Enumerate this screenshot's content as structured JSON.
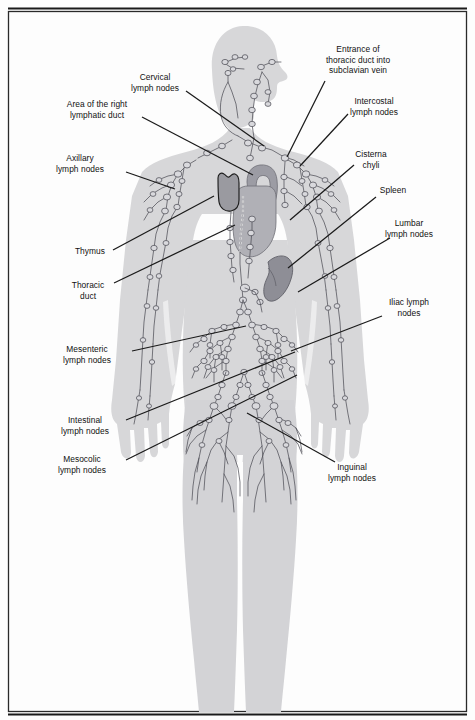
{
  "figure": {
    "title_cutoff": "Lymphatic system",
    "kind": "anatomical-diagram",
    "background_color": "#ffffff",
    "body_fill": "#d7d7d9",
    "body_fill_dark": "#cdcdd0",
    "vessel_color": "#4a4a52",
    "node_fill": "#d9d9dd",
    "thymus_fill": "#9a9aa0",
    "heart_fill": "#b0b0b6",
    "aorta_fill": "#9c9ca4",
    "spleen_fill": "#8e8e96",
    "leader_color": "#1a1a1a",
    "border_color": "#1a1a1a"
  },
  "labels": [
    {
      "id": "cervical",
      "name": "cervical-lymph-nodes",
      "lines": [
        "Cervical",
        "lymph nodes"
      ],
      "text_x": 155,
      "text_y": 80,
      "leader": {
        "x1": 186,
        "y1": 91,
        "x2": 264,
        "y2": 146
      }
    },
    {
      "id": "right-lymphatic-duct",
      "name": "area-of-right-lymphatic-duct",
      "lines": [
        "Area of the right",
        "lymphatic duct"
      ],
      "text_x": 97,
      "text_y": 107,
      "leader": {
        "x1": 142,
        "y1": 117,
        "x2": 253,
        "y2": 175
      }
    },
    {
      "id": "axillary",
      "name": "axillary-lymph-nodes",
      "lines": [
        "Axillary",
        "lymph nodes"
      ],
      "text_x": 80,
      "text_y": 161,
      "leader": {
        "x1": 126,
        "y1": 172,
        "x2": 175,
        "y2": 189
      }
    },
    {
      "id": "thymus",
      "name": "thymus",
      "lines": [
        "Thymus"
      ],
      "text_x": 90,
      "text_y": 254,
      "leader": {
        "x1": 113,
        "y1": 250,
        "x2": 214,
        "y2": 196
      }
    },
    {
      "id": "thoracic-duct",
      "name": "thoracic-duct",
      "lines": [
        "Thoracic",
        "duct"
      ],
      "text_x": 88,
      "text_y": 288,
      "leader": {
        "x1": 114,
        "y1": 283,
        "x2": 235,
        "y2": 225
      }
    },
    {
      "id": "mesenteric",
      "name": "mesenteric-lymph-nodes",
      "lines": [
        "Mesenteric",
        "lymph nodes"
      ],
      "text_x": 87,
      "text_y": 352,
      "leader": {
        "x1": 132,
        "y1": 351,
        "x2": 246,
        "y2": 326
      }
    },
    {
      "id": "intestinal",
      "name": "intestinal-lymph-nodes",
      "lines": [
        "Intestinal",
        "lymph nodes"
      ],
      "text_x": 85,
      "text_y": 423,
      "leader": {
        "x1": 126,
        "y1": 420,
        "x2": 295,
        "y2": 352
      }
    },
    {
      "id": "mesocolic",
      "name": "mesocolic-lymph-nodes",
      "lines": [
        "Mesocolic",
        "lymph nodes"
      ],
      "text_x": 82,
      "text_y": 462,
      "leader": {
        "x1": 126,
        "y1": 460,
        "x2": 297,
        "y2": 375
      }
    },
    {
      "id": "thoracic-duct-entrance",
      "name": "entrance-of-thoracic-duct-into-subclavian-vein",
      "lines": [
        "Entrance of",
        "thoracic duct into",
        "subclavian vein"
      ],
      "text_x": 358,
      "text_y": 52,
      "leader": {
        "x1": 325,
        "y1": 81,
        "x2": 287,
        "y2": 157
      }
    },
    {
      "id": "intercostal",
      "name": "intercostal-lymph-nodes",
      "lines": [
        "Intercostal",
        "lymph nodes"
      ],
      "text_x": 374,
      "text_y": 104,
      "leader": {
        "x1": 348,
        "y1": 114,
        "x2": 300,
        "y2": 166
      }
    },
    {
      "id": "cisterna-chyli",
      "name": "cisterna-chyli",
      "lines": [
        "Cisterna",
        "chyli"
      ],
      "text_x": 371,
      "text_y": 157,
      "leader": {
        "x1": 354,
        "y1": 165,
        "x2": 290,
        "y2": 220
      }
    },
    {
      "id": "spleen",
      "name": "spleen",
      "lines": [
        "Spleen"
      ],
      "text_x": 393,
      "text_y": 193,
      "leader": {
        "x1": 376,
        "y1": 197,
        "x2": 288,
        "y2": 268
      }
    },
    {
      "id": "lumbar",
      "name": "lumbar-lymph-nodes",
      "lines": [
        "Lumbar",
        "lymph nodes"
      ],
      "text_x": 409,
      "text_y": 226,
      "leader": {
        "x1": 390,
        "y1": 238,
        "x2": 298,
        "y2": 292
      }
    },
    {
      "id": "iliac",
      "name": "iliac-lymph-nodes",
      "lines": [
        "Iliac lymph",
        "nodes"
      ],
      "text_x": 409,
      "text_y": 305,
      "leader": {
        "x1": 382,
        "y1": 316,
        "x2": 291,
        "y2": 351
      }
    },
    {
      "id": "inguinal",
      "name": "inguinal-lymph-nodes",
      "lines": [
        "Inguinal",
        "lymph nodes"
      ],
      "text_x": 352,
      "text_y": 470,
      "leader": {
        "x1": 335,
        "y1": 462,
        "x2": 247,
        "y2": 413
      }
    }
  ]
}
